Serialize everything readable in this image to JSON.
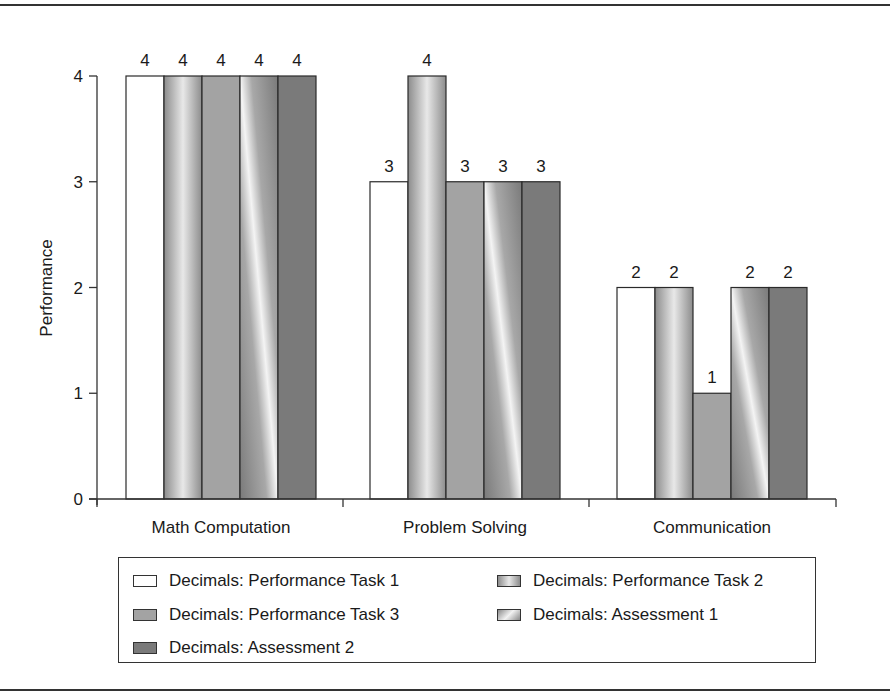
{
  "chart_data": {
    "type": "bar",
    "title": "",
    "xlabel": "",
    "ylabel": "Performance",
    "ylim": [
      0,
      4
    ],
    "yticks": [
      0,
      1,
      2,
      3,
      4
    ],
    "grid": false,
    "legend_position": "bottom",
    "categories": [
      "Math Computation",
      "Problem Solving",
      "Communication"
    ],
    "series": [
      {
        "name": "Decimals: Performance Task 1",
        "values": [
          4,
          3,
          2
        ],
        "fill": "white"
      },
      {
        "name": "Decimals: Performance Task 2",
        "values": [
          4,
          4,
          2
        ],
        "fill": "vertical-gradient-gray"
      },
      {
        "name": "Decimals: Performance Task 3",
        "values": [
          4,
          3,
          1
        ],
        "fill": "medium-gray"
      },
      {
        "name": "Decimals: Assessment 1",
        "values": [
          4,
          3,
          2
        ],
        "fill": "diagonal-gradient-gray"
      },
      {
        "name": "Decimals: Assessment 2",
        "values": [
          4,
          3,
          2
        ],
        "fill": "dark-gray"
      }
    ],
    "data_labels": true
  },
  "legend": {
    "items": [
      "Decimals: Performance Task 1",
      "Decimals: Performance Task 2",
      "Decimals: Performance Task 3",
      "Decimals: Assessment 1",
      "Decimals: Assessment 2"
    ]
  },
  "colors": {
    "axis": "#333333",
    "bar_outline": "#2a2a2a",
    "task1": "#ffffff",
    "task2_light": "#e6e6e6",
    "task2_dark": "#8c8c8c",
    "task3": "#a3a3a3",
    "assess1_light": "#f2f2f2",
    "assess1_dark": "#7d7d7d",
    "assess2": "#7a7a7a"
  }
}
